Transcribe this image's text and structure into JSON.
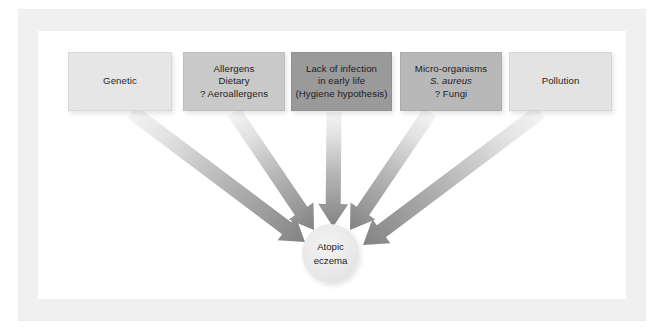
{
  "figure": {
    "frame_color": "#f0f0f0",
    "background_color": "#ffffff"
  },
  "boxes": [
    {
      "id": "genetic",
      "lines": [
        "Genetic"
      ],
      "fill": "#e6e6e6",
      "x": 68,
      "y": 52,
      "w": 104,
      "h": 59
    },
    {
      "id": "allergens",
      "lines": [
        "Allergens",
        "Dietary",
        "? Aeroallergens"
      ],
      "fill": "#c9c9c9",
      "x": 183,
      "y": 52,
      "w": 102,
      "h": 59
    },
    {
      "id": "lack-of-infection",
      "lines": [
        "Lack of infection",
        "in early life",
        "(Hygiene hypothesis)"
      ],
      "fill": "#9a9a9a",
      "x": 291,
      "y": 52,
      "w": 101,
      "h": 59
    },
    {
      "id": "micro-organisms",
      "lines": [
        "Micro-organisms",
        "S. aureus",
        "? Fungi"
      ],
      "italic_lines": [
        1
      ],
      "fill": "#b8b8b8",
      "x": 400,
      "y": 52,
      "w": 102,
      "h": 59
    },
    {
      "id": "pollution",
      "lines": [
        "Pollution"
      ],
      "fill": "#e3e3e3",
      "x": 509,
      "y": 52,
      "w": 103,
      "h": 59
    }
  ],
  "center_node": {
    "id": "atopic-eczema",
    "lines": [
      "Atopic",
      "eczema"
    ],
    "fill": "#e9e9e9",
    "cx": 330.5,
    "cy": 253.5,
    "rx": 28.5,
    "ry": 29.5
  },
  "arrows": [
    {
      "id": "arrow-genetic",
      "from": "genetic",
      "to": "atopic-eczema",
      "start": [
        132,
        112
      ],
      "end": [
        305,
        242
      ],
      "shaft_width": 15,
      "head_width": 30,
      "head_length": 23,
      "color_start": "#f4f4f4",
      "color_end": "#838383"
    },
    {
      "id": "arrow-allergens",
      "from": "allergens",
      "to": "atopic-eczema",
      "start": [
        234,
        112
      ],
      "end": [
        314,
        230
      ],
      "shaft_width": 15,
      "head_width": 30,
      "head_length": 23,
      "color_start": "#f4f4f4",
      "color_end": "#838383"
    },
    {
      "id": "arrow-lack-of-infection",
      "from": "lack-of-infection",
      "to": "atopic-eczema",
      "start": [
        334,
        112
      ],
      "end": [
        333,
        227
      ],
      "shaft_width": 15,
      "head_width": 30,
      "head_length": 23,
      "color_start": "#f4f4f4",
      "color_end": "#838383"
    },
    {
      "id": "arrow-micro-organisms",
      "from": "micro-organisms",
      "to": "atopic-eczema",
      "start": [
        430,
        112
      ],
      "end": [
        350,
        230
      ],
      "shaft_width": 15,
      "head_width": 30,
      "head_length": 23,
      "color_start": "#f4f4f4",
      "color_end": "#838383"
    },
    {
      "id": "arrow-pollution",
      "from": "pollution",
      "to": "atopic-eczema",
      "start": [
        540,
        112
      ],
      "end": [
        363,
        245
      ],
      "shaft_width": 15,
      "head_width": 30,
      "head_length": 23,
      "color_start": "#f4f4f4",
      "color_end": "#838383"
    }
  ]
}
